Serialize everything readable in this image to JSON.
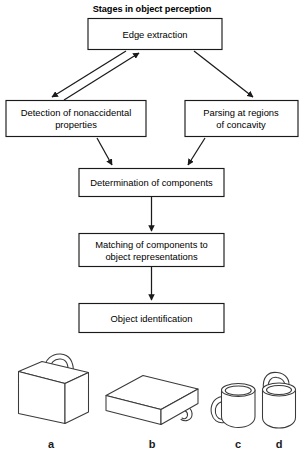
{
  "figure": {
    "title": "Stages in object perception",
    "title_bold": true,
    "background_color": "#ffffff",
    "line_color": "#1a1a1a",
    "object_line_color": "#3a3a3a"
  },
  "flowchart": {
    "type": "diagram",
    "orientation": "top-to-bottom",
    "nodes": [
      {
        "id": "edge_extraction",
        "label": "Edge extraction",
        "lines": [
          "Edge extraction"
        ]
      },
      {
        "id": "nonaccidental",
        "label": "Detection of nonaccidental properties",
        "lines": [
          "Detection of nonaccidental",
          "properties"
        ]
      },
      {
        "id": "parsing",
        "label": "Parsing at regions of concavity",
        "lines": [
          "Parsing at regions",
          "of concavity"
        ]
      },
      {
        "id": "determination",
        "label": "Determination of components",
        "lines": [
          "Determination of components"
        ]
      },
      {
        "id": "matching",
        "label": "Matching of components to object representations",
        "lines": [
          "Matching of components to",
          "object representations"
        ]
      },
      {
        "id": "identification",
        "label": "Object identification",
        "lines": [
          "Object identification"
        ]
      }
    ],
    "edges": [
      {
        "from": "edge_extraction",
        "to": "nonaccidental",
        "arrow": "to",
        "style": "diagonal"
      },
      {
        "from": "nonaccidental",
        "to": "edge_extraction",
        "arrow": "to",
        "style": "diagonal"
      },
      {
        "from": "edge_extraction",
        "to": "parsing",
        "arrow": "to",
        "style": "diagonal"
      },
      {
        "from": "nonaccidental",
        "to": "determination",
        "arrow": "to",
        "style": "diagonal"
      },
      {
        "from": "parsing",
        "to": "determination",
        "arrow": "to",
        "style": "diagonal"
      },
      {
        "from": "determination",
        "to": "matching",
        "arrow": "to",
        "style": "vertical"
      },
      {
        "from": "matching",
        "to": "identification",
        "arrow": "to",
        "style": "vertical"
      }
    ]
  },
  "objects": {
    "items": [
      {
        "id": "briefcase",
        "label": "a",
        "description": "upright briefcase with arched handle"
      },
      {
        "id": "flat_case",
        "label": "b",
        "description": "flat box lying down with side handle"
      },
      {
        "id": "mug",
        "label": "c",
        "description": "cylindrical mug with side handle"
      },
      {
        "id": "pail",
        "label": "d",
        "description": "cylindrical pail with arched handle on top"
      }
    ]
  }
}
